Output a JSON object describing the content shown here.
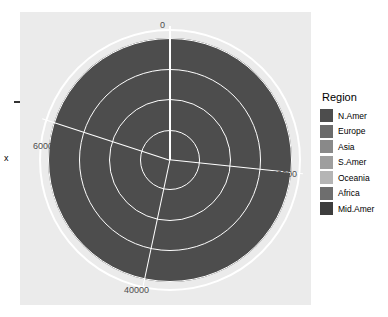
{
  "chart_data": {
    "type": "pie",
    "title": "",
    "xlabel": "x",
    "ylabel": "",
    "legend_title": "Region",
    "legend_position": "right",
    "grid": true,
    "axis_ticks": [
      {
        "label": "0",
        "value": 0,
        "position": "top"
      },
      {
        "label": "20000",
        "value": 20000,
        "position": "right"
      },
      {
        "label": "40000",
        "value": 40000,
        "position": "bottom"
      },
      {
        "label": "60000",
        "value": 60000,
        "position": "left"
      }
    ],
    "axis_range": [
      0,
      75000
    ],
    "categories": [
      "N.Amer",
      "Europe",
      "Asia",
      "S.Amer",
      "Oceania",
      "Africa",
      "Mid.Amer"
    ],
    "values": [
      36200,
      2600,
      2100,
      500,
      120,
      18500,
      60
    ],
    "colors": [
      "#4d4d4d",
      "#6b6b6b",
      "#898989",
      "#9e9e9e",
      "#b5b5b5",
      "#6e6e6e",
      "#3d3d3d"
    ],
    "slices": [
      {
        "name": "N.Amer",
        "value": 36200,
        "color": "#4d4d4d",
        "start_deg": 184.5,
        "end_deg": 360.0
      },
      {
        "name": "Europe",
        "value": 2600,
        "color": "#6b6b6b",
        "start_deg": 0.0,
        "end_deg": 12.6
      },
      {
        "name": "Asia",
        "value": 2100,
        "color": "#898989",
        "start_deg": 12.6,
        "end_deg": 22.8
      },
      {
        "name": "S.Amer",
        "value": 500,
        "color": "#9e9e9e",
        "start_deg": 22.8,
        "end_deg": 25.2
      },
      {
        "name": "Oceania",
        "value": 120,
        "color": "#b5b5b5",
        "start_deg": 25.2,
        "end_deg": 25.8
      },
      {
        "name": "Africa",
        "value": 18500,
        "color": "#6e6e6e",
        "start_deg": 25.8,
        "end_deg": 184.2
      },
      {
        "name": "Mid.Amer",
        "value": 60,
        "color": "#3d3d3d",
        "start_deg": 184.2,
        "end_deg": 184.5
      }
    ]
  },
  "legend": {
    "title": "Region",
    "entries": [
      {
        "label": "N.Amer",
        "color": "#4d4d4d"
      },
      {
        "label": "Europe",
        "color": "#6b6b6b"
      },
      {
        "label": "Asia",
        "color": "#898989"
      },
      {
        "label": "S.Amer",
        "color": "#9e9e9e"
      },
      {
        "label": "Oceania",
        "color": "#b5b5b5"
      },
      {
        "label": "Africa",
        "color": "#6e6e6e"
      },
      {
        "label": "Mid.Amer",
        "color": "#3d3d3d"
      }
    ]
  },
  "axis": {
    "x_title": "x",
    "tick_top": "0",
    "tick_right": "20000",
    "tick_bottom": "40000",
    "tick_left": "60000"
  },
  "theme": {
    "panel_background": "#ebebeb",
    "grid_color": "#ffffff",
    "plot_background": "#ffffff",
    "tick_text_color": "#4d4d4d"
  }
}
